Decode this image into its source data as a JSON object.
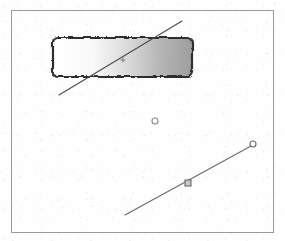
{
  "document": {
    "title": "Scanned Geometric Diagram",
    "page_background": "#fefefe",
    "content_type": "line-drawing"
  },
  "frame": {
    "name": "page-border",
    "x": 11,
    "y": 10,
    "width": 262,
    "height": 222,
    "stroke": "#9a9a9e",
    "stroke_width": 1
  },
  "shapes": {
    "rectangle": {
      "label": "gradient-rectangle",
      "x": 52,
      "y": 37,
      "width": 140,
      "height": 39,
      "corner_radius": 5,
      "stroke": "#2e2e2e",
      "stroke_width": 2,
      "fill_start": "#ffffff",
      "fill_end": "#9e9e9e",
      "fill_direction": "left-to-right",
      "border_style": "rough-hand-drawn"
    },
    "upper_line": {
      "label": "upper-diagonal-line",
      "x1": 59,
      "y1": 95,
      "x2": 182,
      "y2": 21,
      "stroke": "#4a4a4a",
      "stroke_width": 1
    },
    "lower_line": {
      "label": "lower-diagonal-line",
      "x1": 125,
      "y1": 215,
      "x2": 251,
      "y2": 146,
      "stroke": "#6a6a70",
      "stroke_width": 1
    }
  },
  "markers": {
    "plus": {
      "label": "plus-marker",
      "cx": 123,
      "cy": 60,
      "size": 5,
      "stroke": "#7a7a7e"
    },
    "center_circle": {
      "label": "center-circle-marker",
      "cx": 155,
      "cy": 121,
      "radius": 3,
      "stroke": "#8a8a8e",
      "fill": "none"
    },
    "endpoint_circle": {
      "label": "line-endpoint-circle",
      "cx": 253,
      "cy": 144,
      "radius": 3,
      "stroke": "#6a6a70",
      "fill": "none"
    },
    "midpoint_square": {
      "label": "line-midpoint-square",
      "cx": 188,
      "cy": 183,
      "size": 6,
      "stroke": "#5a5a60",
      "fill": "#c8c8cc"
    }
  }
}
